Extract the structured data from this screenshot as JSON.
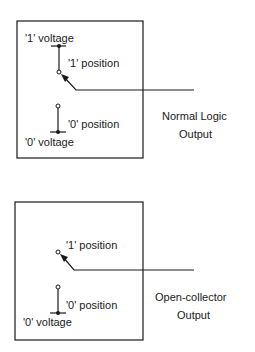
{
  "diagrams": [
    {
      "id": "normal",
      "one_voltage": "'1'  voltage",
      "one_position": "'1'  position",
      "zero_position": "'0'  position",
      "zero_voltage": "'0'  voltage",
      "caption_line1": "Normal  Logic",
      "caption_line2": "Output"
    },
    {
      "id": "open-collector",
      "one_position": "'1'  position",
      "zero_position": "'0'  position",
      "zero_voltage": "'0'  voltage",
      "caption_line1": "Open-collector",
      "caption_line2": "Output"
    }
  ],
  "colors": {
    "ink": "#1a1a1a",
    "background": "#ffffff"
  }
}
